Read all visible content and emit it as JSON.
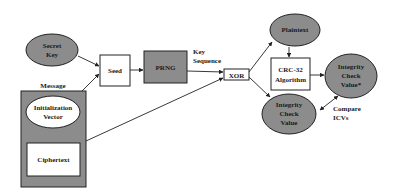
{
  "diagram": {
    "nodes": {
      "secret_key": {
        "label_lines": [
          "Secret",
          "Key"
        ],
        "shape": "ellipse",
        "fill": "#8c8c8c"
      },
      "seed": {
        "label": "Seed",
        "shape": "rect",
        "fill": "#ffffff"
      },
      "prng": {
        "label": "PRNG",
        "shape": "rect",
        "fill": "#8c8c8c"
      },
      "xor": {
        "label": "XOR",
        "shape": "rect",
        "fill": "#ffffff"
      },
      "message": {
        "label": "Message",
        "shape": "rect",
        "fill": "#8c8c8c"
      },
      "init_vector": {
        "label_lines": [
          "Initialization",
          "Vector"
        ],
        "shape": "ellipse",
        "fill": "#ffffff"
      },
      "ciphertext": {
        "label": "Ciphertext",
        "shape": "rect",
        "fill": "#ffffff"
      },
      "plaintext": {
        "label": "Plaintext",
        "shape": "ellipse",
        "fill": "#8c8c8c"
      },
      "crc32": {
        "label_lines": [
          "CRC-32",
          "Algorithm"
        ],
        "shape": "rect",
        "fill": "#ffffff"
      },
      "icv_star": {
        "label_lines": [
          "Integrity",
          "Check",
          "Value*"
        ],
        "shape": "ellipse",
        "fill": "#8c8c8c"
      },
      "icv": {
        "label_lines": [
          "Integrity",
          "Check",
          "Value"
        ],
        "shape": "ellipse",
        "fill": "#8c8c8c"
      }
    },
    "edge_labels": {
      "key_sequence": [
        "Key",
        "Sequence"
      ],
      "compare_icvs": [
        "Compare",
        "ICVs"
      ]
    },
    "edges": [
      {
        "from": "secret_key",
        "to": "seed"
      },
      {
        "from": "init_vector",
        "to": "seed"
      },
      {
        "from": "seed",
        "to": "prng"
      },
      {
        "from": "prng",
        "to": "xor",
        "label": "Key Sequence"
      },
      {
        "from": "message",
        "to": "xor"
      },
      {
        "from": "xor",
        "to": "plaintext"
      },
      {
        "from": "xor",
        "to": "icv"
      },
      {
        "from": "plaintext",
        "to": "crc32"
      },
      {
        "from": "crc32",
        "to": "icv_star"
      },
      {
        "from": "icv",
        "to": "icv_star",
        "bidirectional": true,
        "label": "Compare ICVs"
      }
    ]
  }
}
